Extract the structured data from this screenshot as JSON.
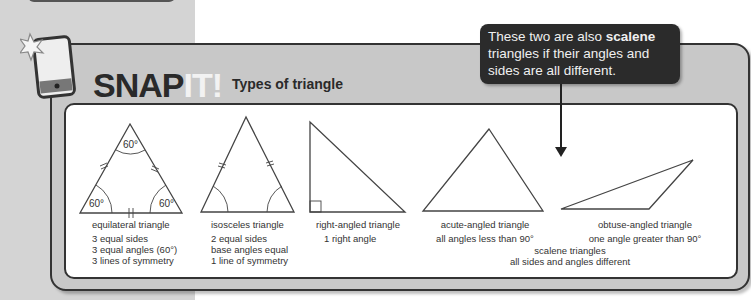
{
  "header": {
    "brand_dark": "SNAP",
    "brand_light": "IT!",
    "subtitle": "Types of triangle"
  },
  "callout": {
    "text_before": "These two are also ",
    "text_bold": "scalene",
    "text_after": " triangles if their angles and sides are all different."
  },
  "triangles": [
    {
      "name": "equilateral triangle",
      "lines": [
        "3 equal sides",
        "3 equal angles (60°)",
        "3 lines of symmetry"
      ],
      "angle_labels": [
        "60°",
        "60°",
        "60°"
      ]
    },
    {
      "name": "isosceles triangle",
      "lines": [
        "2 equal sides",
        "base angles equal",
        "1 line of symmetry"
      ]
    },
    {
      "name": "right-angled triangle",
      "lines": [
        "1 right angle"
      ]
    },
    {
      "name": "acute-angled triangle",
      "lines": [
        "all angles less than 90°"
      ]
    },
    {
      "name": "obtuse-angled triangle",
      "lines": [
        "one angle greater than 90°"
      ]
    }
  ],
  "scalene_note": {
    "title": "scalene triangles",
    "desc": "all sides and angles different"
  }
}
